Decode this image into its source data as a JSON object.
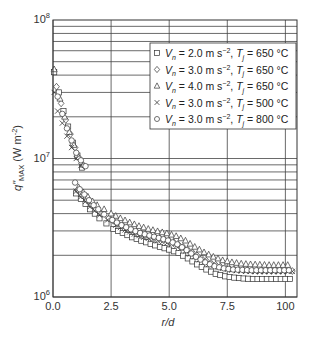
{
  "chart_data": {
    "type": "scatter",
    "title": "",
    "xlabel": "r/d",
    "ylabel": "q\"MAX (W m-2)",
    "ylabel_parts": {
      "q": "q\"",
      "sub": "MAX",
      "unit": " (W m",
      "exp": "-2",
      "close": ")"
    },
    "xlim": [
      0,
      10.5
    ],
    "ylim": [
      1000000,
      100000000
    ],
    "yscale": "log",
    "grid": true,
    "legend_position": "upper right",
    "x_ticks": [
      {
        "value": 0.0,
        "label": "0.0"
      },
      {
        "value": 2.5,
        "label": "2.5"
      },
      {
        "value": 5.0,
        "label": "5.0"
      },
      {
        "value": 7.5,
        "label": "7.5"
      },
      {
        "value": 10.0,
        "label": "100"
      }
    ],
    "y_ticks": [
      {
        "value": 1000000,
        "base": "10",
        "exp": "6"
      },
      {
        "value": 10000000,
        "base": "10",
        "exp": "7"
      },
      {
        "value": 100000000,
        "base": "10",
        "exp": "8"
      }
    ],
    "series": [
      {
        "name": "Vn = 2.0 m s-2, Tj = 650 °C",
        "legend": {
          "v": "V",
          "vsub": "n",
          "vval": " = 2.0 m s",
          "vexp": "−2",
          "sep": ", ",
          "t": "T",
          "tsub": "j",
          "tval": " = 650 °C"
        },
        "marker": "square",
        "x": [
          0.05,
          0.25,
          0.45,
          0.65,
          0.85,
          1.05,
          1.25,
          1.0,
          1.2,
          1.4,
          1.6,
          1.8,
          2.0,
          2.3,
          2.6,
          3.0,
          3.4,
          3.8,
          4.2,
          4.6,
          5.0,
          5.4,
          5.8,
          6.2,
          6.6,
          7.0,
          7.4,
          7.8,
          8.2,
          8.6,
          9.0,
          9.4,
          9.8,
          10.2
        ],
        "y": [
          42000000,
          30000000,
          22000000,
          17000000,
          13000000,
          10500000,
          8600000,
          5600000,
          5100000,
          4700000,
          4300000,
          4000000,
          3700000,
          3400000,
          3100000,
          2900000,
          2700000,
          2550000,
          2420000,
          2300000,
          2200000,
          2080000,
          1900000,
          1720000,
          1580000,
          1470000,
          1410000,
          1380000,
          1360000,
          1350000,
          1350000,
          1350000,
          1350000,
          1350000
        ]
      },
      {
        "name": "Vn = 3.0 m s-2, Tj = 650 °C",
        "legend": {
          "v": "V",
          "vsub": "n",
          "vval": " = 3.0 m s",
          "vexp": "−2",
          "sep": ", ",
          "t": "T",
          "tsub": "j",
          "tval": " = 650 °C"
        },
        "marker": "diamond",
        "x": [
          0.15,
          0.35,
          0.55,
          0.75,
          0.95,
          1.15,
          1.35,
          1.05,
          1.25,
          1.45,
          1.65,
          1.85,
          2.1,
          2.4,
          2.8,
          3.2,
          3.6,
          4.0,
          4.4,
          4.8,
          5.2,
          5.6,
          6.0,
          6.4,
          6.8,
          7.2,
          7.6,
          8.0,
          8.4,
          8.8,
          9.2,
          9.6,
          10.0,
          10.3
        ],
        "y": [
          33000000,
          25000000,
          19000000,
          15000000,
          12000000,
          10000000,
          8800000,
          5900000,
          5400000,
          5000000,
          4600000,
          4300000,
          4000000,
          3700000,
          3400000,
          3150000,
          2950000,
          2800000,
          2700000,
          2600000,
          2480000,
          2300000,
          2100000,
          1900000,
          1760000,
          1660000,
          1600000,
          1570000,
          1550000,
          1540000,
          1540000,
          1540000,
          1540000,
          1540000
        ]
      },
      {
        "name": "Vn = 4.0 m s-2, Tj = 650 °C",
        "legend": {
          "v": "V",
          "vsub": "n",
          "vval": " = 4.0 m s",
          "vexp": "−2",
          "sep": ", ",
          "t": "T",
          "tsub": "j",
          "tval": " = 650 °C"
        },
        "marker": "triangle",
        "x": [
          0.05,
          0.3,
          0.5,
          0.7,
          0.9,
          1.1,
          1.3,
          1.1,
          1.3,
          1.5,
          1.7,
          1.9,
          2.2,
          2.5,
          2.9,
          3.3,
          3.7,
          4.1,
          4.5,
          4.9,
          5.3,
          5.7,
          6.1,
          6.5,
          6.9,
          7.3,
          7.7,
          8.1,
          8.5,
          8.9,
          9.3,
          9.7,
          10.1
        ],
        "y": [
          44000000,
          27000000,
          20000000,
          15500000,
          12500000,
          10200000,
          9000000,
          6200000,
          5700000,
          5300000,
          4900000,
          4600000,
          4300000,
          4000000,
          3700000,
          3450000,
          3250000,
          3100000,
          2980000,
          2880000,
          2750000,
          2550000,
          2300000,
          2100000,
          1950000,
          1840000,
          1780000,
          1740000,
          1720000,
          1710000,
          1700000,
          1700000,
          1700000
        ]
      },
      {
        "name": "Vn = 3.0 m s-2, Tj = 500 °C",
        "legend": {
          "v": "V",
          "vsub": "n",
          "vval": " = 3.0 m s",
          "vexp": "−2",
          "sep": ", ",
          "t": "T",
          "tsub": "j",
          "tval": " = 500 °C"
        },
        "marker": "cross",
        "x": [
          0.05,
          0.2,
          0.4,
          0.6,
          0.8,
          1.0,
          1.2,
          1.0,
          1.2,
          1.4,
          1.6,
          1.8,
          2.0,
          2.35,
          2.7,
          3.1,
          3.5,
          3.9,
          4.3,
          4.7,
          5.1,
          5.5,
          5.9,
          6.3,
          6.7,
          7.1,
          7.5,
          7.9,
          8.3,
          8.7,
          9.1,
          9.5,
          9.9,
          10.3
        ],
        "y": [
          30000000,
          22000000,
          18000000,
          14500000,
          12000000,
          10000000,
          8900000,
          5800000,
          5300000,
          4900000,
          4500000,
          4200000,
          3900000,
          3600000,
          3300000,
          3050000,
          2850000,
          2700000,
          2600000,
          2500000,
          2400000,
          2250000,
          2050000,
          1860000,
          1720000,
          1630000,
          1580000,
          1550000,
          1540000,
          1530000,
          1530000,
          1530000,
          1530000,
          1530000
        ]
      },
      {
        "name": "Vn = 3.0 m s-2, Tj = 800 °C",
        "legend": {
          "v": "V",
          "vsub": "n",
          "vval": " = 3.0 m s",
          "vexp": "−2",
          "sep": ", ",
          "t": "T",
          "tsub": "j",
          "tval": " = 800 °C"
        },
        "marker": "circle",
        "x": [
          0.2,
          0.4,
          0.6,
          0.8,
          1.0,
          1.2,
          1.4,
          0.95,
          1.15,
          1.35,
          1.55,
          1.75,
          1.95,
          2.2,
          2.55,
          2.95,
          3.35,
          3.75,
          4.15,
          4.55,
          4.95,
          5.35,
          5.75,
          6.15,
          6.55,
          6.95,
          7.35,
          7.75,
          8.15,
          8.55,
          8.95,
          9.35,
          9.75,
          10.15
        ],
        "y": [
          28000000,
          21000000,
          16500000,
          13500000,
          11000000,
          9700000,
          8800000,
          6700000,
          6000000,
          5500000,
          5000000,
          4600000,
          4300000,
          3950000,
          3600000,
          3300000,
          3080000,
          2900000,
          2780000,
          2670000,
          2560000,
          2400000,
          2180000,
          1950000,
          1780000,
          1670000,
          1610000,
          1580000,
          1570000,
          1560000,
          1560000,
          1560000,
          1560000,
          1560000
        ]
      }
    ]
  },
  "colors": {
    "axis": "#333333",
    "grid": "#444444",
    "marker": "#333333",
    "background": "#ffffff"
  }
}
